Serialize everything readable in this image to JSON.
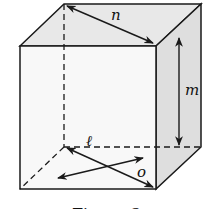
{
  "diagram": {
    "type": "cube",
    "labels": {
      "top_face_diagonal": "n",
      "right_edge_height": "m",
      "bottom_diagonal_1": "ℓ",
      "bottom_diagonal_2": "o"
    },
    "caption": "Figure 3",
    "colors": {
      "stroke": "#1a1a1a",
      "face_top": "#e6e6e6",
      "face_right": "#dcdcdc",
      "face_front": "#f7f7f7"
    }
  }
}
